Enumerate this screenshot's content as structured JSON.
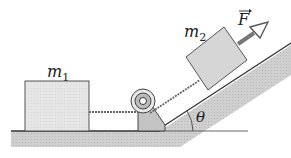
{
  "diagram": {
    "type": "physics-incline-pulley",
    "labels": {
      "mass1": "m",
      "mass1_sub": "1",
      "mass2": "m",
      "mass2_sub": "2",
      "force": "F",
      "angle": "θ"
    },
    "colors": {
      "block_fill": "#e2e2e2",
      "ground_fill": "#c8c8c8",
      "line": "#333333"
    }
  }
}
